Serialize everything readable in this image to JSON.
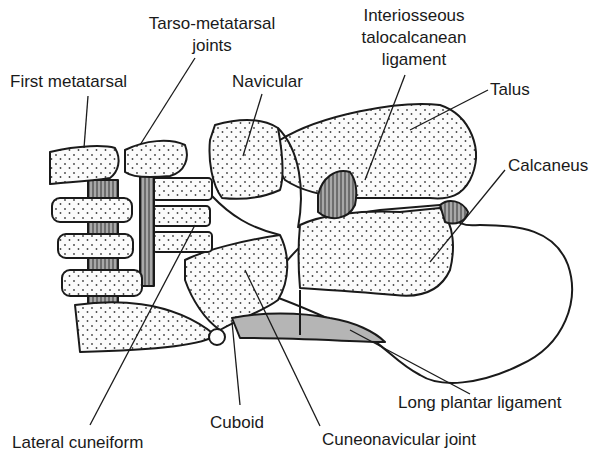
{
  "figure": {
    "colors": {
      "outline": "#1a1a1a",
      "bone_fill": "#fbfbfb",
      "stipple": "#444444",
      "cartilage": "#9a9a9a",
      "ligament_fill": "#b5b5b5"
    }
  },
  "labels": {
    "first_metatarsal": "First metatarsal",
    "tarso_metatarsal_1": "Tarso-metatarsal",
    "tarso_metatarsal_2": "joints",
    "navicular": "Navicular",
    "interosseous_1": "Interiosseous",
    "interosseous_2": "talocalcanean",
    "interosseous_3": "ligament",
    "talus": "Talus",
    "calcaneus": "Calcaneus",
    "long_plantar": "Long plantar ligament",
    "cuboid": "Cuboid",
    "lateral_cuneiform": "Lateral cuneiform",
    "cuneonavicular": "Cuneonavicular joint"
  }
}
